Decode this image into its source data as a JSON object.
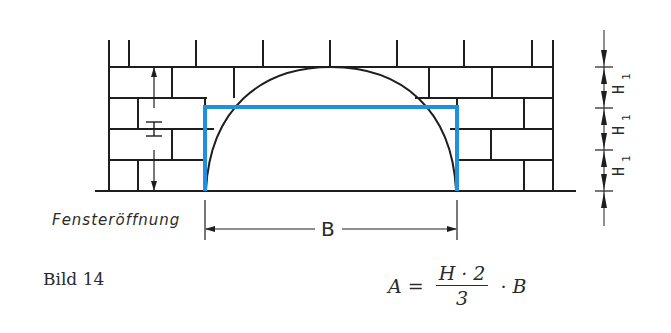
{
  "figure": {
    "caption": "Bild 14",
    "opening_label": "Fensteröffnung",
    "dimension_labels": {
      "height": "H",
      "width": "B",
      "course_height": "H",
      "course_height_subscript": "1"
    },
    "formula": {
      "lhs": "A",
      "equals": "=",
      "numerator": "H · 2",
      "denominator": "3",
      "times": "·",
      "rhs": "B"
    },
    "colors": {
      "line": "#1e1e1e",
      "window_outline": "#1e90e0",
      "text": "#2a2a2a"
    }
  }
}
